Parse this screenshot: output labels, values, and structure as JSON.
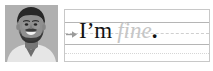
{
  "app": {
    "type": "handwriting-practice-card",
    "background_color": "#ffffff"
  },
  "photo": {
    "alt_label": "portrait-photo",
    "subject": "smiling bearded man",
    "style": "grayscale",
    "colors": {
      "background": "#b9b9b9",
      "hair": "#2b2b2b",
      "beard": "#3a3a3a",
      "skin": "#8d8d8d",
      "shirt": "#e8e8e8",
      "collar": "#f5f5f5"
    }
  },
  "writing_panel": {
    "border_color": "#c8c8c8",
    "rules": [
      {
        "name": "top-line",
        "style": "solid",
        "color": "#b5b5b5"
      },
      {
        "name": "midline",
        "style": "dashed",
        "color": "#cfcfcf"
      },
      {
        "name": "baseline",
        "style": "solid",
        "color": "#b5b5b5"
      },
      {
        "name": "descender-line",
        "style": "dotted",
        "color": "#d6d6d6"
      }
    ],
    "cue": {
      "icon": "arrow-right-icon",
      "color": "#9a9a9a"
    },
    "text": {
      "typed": "I’m",
      "ghost": "fine",
      "punctuation": ".",
      "typed_color": "#121212",
      "ghost_color": "#c6c6c6",
      "punctuation_color": "#121212",
      "full_sentence": "I’m fine."
    }
  }
}
